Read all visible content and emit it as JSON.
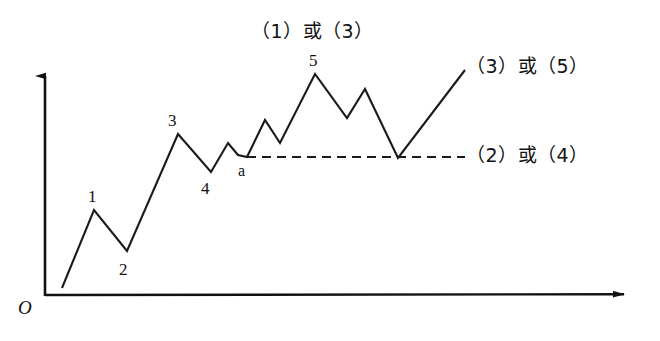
{
  "figure": {
    "title": "",
    "type": "elliott-wave-schematic",
    "background_color": "#ffffff",
    "line_color": "#1a1a1a",
    "axis_color": "#111111"
  },
  "axes": {
    "origin_label": "O",
    "y_axis": {
      "x": 45,
      "y_top": 70,
      "y_bottom": 296,
      "arrow": "up"
    },
    "x_axis": {
      "y": 295,
      "x_left": 45,
      "x_right": 634,
      "arrow": "right"
    }
  },
  "chart_data": {
    "type": "line",
    "title": "",
    "xlabel": "",
    "ylabel": "",
    "grid": false,
    "legend": "none",
    "xlim": [
      45,
      634
    ],
    "ylim": [
      295,
      60
    ],
    "series": [
      {
        "name": "impulse-correction-wave",
        "style": "solid",
        "points": [
          [
            62,
            288
          ],
          [
            94,
            210
          ],
          [
            127,
            251
          ],
          [
            178,
            134
          ],
          [
            211,
            172
          ],
          [
            228,
            143
          ],
          [
            238,
            155
          ],
          [
            247,
            157
          ],
          [
            265,
            120
          ],
          [
            280,
            143
          ],
          [
            315,
            74
          ],
          [
            347,
            118
          ],
          [
            365,
            89
          ],
          [
            398,
            158
          ],
          [
            465,
            70
          ]
        ]
      },
      {
        "name": "correction-base-dashed",
        "style": "dashed",
        "points": [
          [
            247,
            157
          ],
          [
            465,
            157
          ]
        ]
      }
    ],
    "point_labels": [
      {
        "id": "wave-1",
        "text": "1",
        "x": 88,
        "y": 188,
        "anchor": "point",
        "px": 94,
        "py": 210
      },
      {
        "id": "wave-2",
        "text": "2",
        "x": 119,
        "y": 261,
        "anchor": "point",
        "px": 127,
        "py": 251
      },
      {
        "id": "wave-3",
        "text": "3",
        "x": 168,
        "y": 112,
        "anchor": "point",
        "px": 178,
        "py": 134
      },
      {
        "id": "wave-4",
        "text": "4",
        "x": 201,
        "y": 180,
        "anchor": "point",
        "px": 211,
        "py": 172
      },
      {
        "id": "wave-5",
        "text": "5",
        "x": 309,
        "y": 52,
        "anchor": "point",
        "px": 315,
        "py": 74
      },
      {
        "id": "wave-a",
        "text": "a",
        "x": 238,
        "y": 163,
        "anchor": "point",
        "px": 247,
        "py": 157
      }
    ],
    "annotations": [
      {
        "id": "top-label",
        "text": "（1）或（3）",
        "x": 251,
        "y": 22
      },
      {
        "id": "upper-right-label",
        "text": "（3）或（5）",
        "x": 466,
        "y": 57
      },
      {
        "id": "lower-right-label",
        "text": "（2）或（4）",
        "x": 466,
        "y": 146
      }
    ]
  }
}
